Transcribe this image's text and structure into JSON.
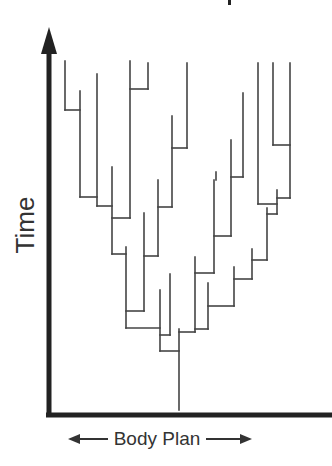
{
  "diagram": {
    "type": "phylogenetic-tree",
    "y_axis_label": "Time",
    "x_axis_label": "Body Plan",
    "x_axis_left_arrow": "⟵",
    "x_axis_right_arrow": "⟶",
    "colors": {
      "axis": "#222222",
      "branch": "#444444",
      "label": "#333333",
      "background": "#ffffff"
    },
    "axes": {
      "vertical": {
        "x": 49,
        "y_top": 27,
        "y_bottom": 416
      },
      "horizontal": {
        "y": 415,
        "x_left": 46,
        "x_right": 332
      }
    },
    "branches": [
      [
        65,
        61,
        65,
        110
      ],
      [
        65,
        110,
        80,
        110
      ],
      [
        80,
        91,
        80,
        197
      ],
      [
        80,
        197,
        97,
        197
      ],
      [
        97,
        74,
        97,
        206
      ],
      [
        97,
        206,
        112,
        206
      ],
      [
        130,
        61,
        130,
        218
      ],
      [
        112,
        218,
        130,
        218
      ],
      [
        148,
        63,
        148,
        89
      ],
      [
        130,
        89,
        148,
        89
      ],
      [
        112,
        167,
        112,
        254
      ],
      [
        112,
        254,
        126,
        254
      ],
      [
        126,
        247,
        126,
        328
      ],
      [
        144,
        213,
        144,
        311
      ],
      [
        126,
        311,
        144,
        311
      ],
      [
        158,
        180,
        158,
        256
      ],
      [
        144,
        256,
        158,
        256
      ],
      [
        172,
        116,
        172,
        207
      ],
      [
        158,
        207,
        172,
        207
      ],
      [
        187,
        63,
        187,
        148
      ],
      [
        172,
        148,
        187,
        148
      ],
      [
        126,
        328,
        160,
        328
      ],
      [
        160,
        290,
        160,
        351
      ],
      [
        170,
        274,
        170,
        335
      ],
      [
        160,
        335,
        170,
        335
      ],
      [
        160,
        351,
        179,
        351
      ],
      [
        179,
        329,
        179,
        410
      ],
      [
        179,
        332,
        195,
        332
      ],
      [
        195,
        257,
        195,
        332
      ],
      [
        214,
        180,
        214,
        273
      ],
      [
        195,
        273,
        214,
        273
      ],
      [
        216,
        172,
        216,
        180
      ],
      [
        231,
        140,
        231,
        236
      ],
      [
        214,
        236,
        231,
        236
      ],
      [
        243,
        93,
        243,
        177
      ],
      [
        231,
        177,
        243,
        177
      ],
      [
        208,
        283,
        208,
        329
      ],
      [
        195,
        329,
        208,
        329
      ],
      [
        234,
        267,
        234,
        306
      ],
      [
        208,
        306,
        234,
        306
      ],
      [
        252,
        249,
        252,
        279
      ],
      [
        234,
        279,
        252,
        279
      ],
      [
        267,
        208,
        267,
        260
      ],
      [
        252,
        260,
        267,
        260
      ],
      [
        277,
        190,
        277,
        214
      ],
      [
        267,
        214,
        277,
        214
      ],
      [
        258,
        63,
        258,
        204
      ],
      [
        258,
        204,
        277,
        204
      ],
      [
        273,
        63,
        273,
        145
      ],
      [
        273,
        145,
        290,
        145
      ],
      [
        290,
        63,
        290,
        198
      ],
      [
        277,
        198,
        290,
        198
      ]
    ]
  }
}
